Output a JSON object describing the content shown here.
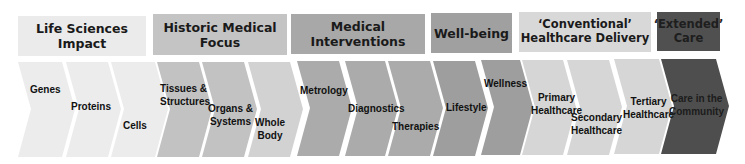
{
  "colors": {
    "light": "#ebebeb",
    "mid_light": "#d4d4d4",
    "mid": "#b7b7b7",
    "mid_dark": "#a3a3a3",
    "conventional": "#d6d6d6",
    "dark": "#525252",
    "text": "#111111"
  },
  "headers": [
    {
      "id": "life-sciences-impact",
      "lines": [
        "Life Sciences Impact"
      ]
    },
    {
      "id": "historic-medical-focus",
      "lines": [
        "Historic Medical Focus"
      ]
    },
    {
      "id": "medical-interventions",
      "lines": [
        "Medical Interventions"
      ]
    },
    {
      "id": "well-being",
      "lines": [
        "Well-being"
      ]
    },
    {
      "id": "conventional-healthcare-delivery",
      "lines": [
        "‘Conventional’",
        "Healthcare Delivery"
      ]
    },
    {
      "id": "extended-care",
      "lines": [
        "‘Extended’",
        "Care"
      ]
    }
  ],
  "chevrons": [
    {
      "group": "life-sciences-impact",
      "lines": [
        "Genes"
      ]
    },
    {
      "group": "life-sciences-impact",
      "lines": [
        "Proteins"
      ]
    },
    {
      "group": "life-sciences-impact",
      "lines": [
        "Cells"
      ]
    },
    {
      "group": "historic-medical-focus",
      "lines": [
        "Tissues &",
        "Structures"
      ]
    },
    {
      "group": "historic-medical-focus",
      "lines": [
        "Organs &",
        "Systems"
      ]
    },
    {
      "group": "historic-medical-focus",
      "lines": [
        "Whole",
        "Body"
      ]
    },
    {
      "group": "medical-interventions",
      "lines": [
        "Metrology"
      ]
    },
    {
      "group": "medical-interventions",
      "lines": [
        "Diagnostics"
      ]
    },
    {
      "group": "medical-interventions",
      "lines": [
        "Therapies"
      ]
    },
    {
      "group": "well-being",
      "lines": [
        "Lifestyle"
      ]
    },
    {
      "group": "well-being",
      "lines": [
        "Wellness"
      ]
    },
    {
      "group": "conventional-healthcare-delivery",
      "lines": [
        "Primary",
        "Healthcare"
      ]
    },
    {
      "group": "conventional-healthcare-delivery",
      "lines": [
        "Secondary",
        "Healthcare"
      ]
    },
    {
      "group": "conventional-healthcare-delivery",
      "lines": [
        "Tertiary",
        "Healthcare"
      ]
    },
    {
      "group": "extended-care",
      "lines": [
        "Care in the",
        "Community"
      ]
    }
  ]
}
